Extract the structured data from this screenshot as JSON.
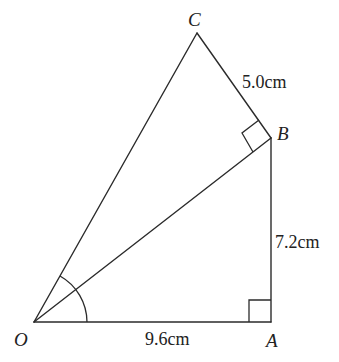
{
  "diagram": {
    "type": "geometry-figure",
    "colors": {
      "stroke": "#2b2b2b",
      "text": "#222222",
      "background": "#ffffff"
    },
    "points": {
      "O": {
        "label": "O",
        "x": 34,
        "y": 322
      },
      "A": {
        "label": "A",
        "x": 271,
        "y": 322
      },
      "B": {
        "label": "B",
        "x": 271,
        "y": 138
      },
      "C": {
        "label": "C",
        "x": 197,
        "y": 33
      }
    },
    "segments": [
      {
        "from": "O",
        "to": "A"
      },
      {
        "from": "A",
        "to": "B"
      },
      {
        "from": "O",
        "to": "B"
      },
      {
        "from": "O",
        "to": "C"
      },
      {
        "from": "B",
        "to": "C"
      }
    ],
    "lengths": {
      "OA": "9.6cm",
      "AB": "7.2cm",
      "BC": "5.0cm"
    },
    "right_angles": [
      "A",
      "B"
    ],
    "angle_mark": {
      "vertex": "O",
      "between": [
        "A",
        "C"
      ],
      "type": "arc"
    }
  }
}
